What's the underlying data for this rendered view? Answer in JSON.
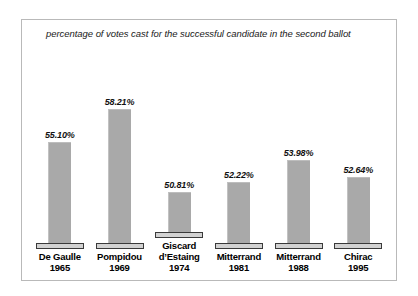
{
  "chart_data": {
    "type": "bar",
    "title": "percentage of votes cast for the successful candidate in the second ballot",
    "xlabel": "",
    "ylabel": "",
    "grid": false,
    "legend": "none",
    "ylim": [
      49.5,
      59.5
    ],
    "value_suffix": "%",
    "categories": [
      "De Gaulle 1965",
      "Pompidou 1969",
      "Giscard d'Estaing 1974",
      "Mitterrand 1981",
      "Mitterrand 1988",
      "Chirac 1995"
    ],
    "values": [
      55.1,
      58.21,
      50.81,
      52.22,
      53.98,
      52.64
    ],
    "bars": [
      {
        "name": "De Gaulle",
        "year": "1965",
        "value": 55.1,
        "value_label": "55.10%",
        "name_lines": [
          "De Gaulle",
          "1965"
        ],
        "bar_height_px": 101
      },
      {
        "name": "Pompidou",
        "year": "1969",
        "value": 58.21,
        "value_label": "58.21%",
        "name_lines": [
          "Pompidou",
          "1969"
        ],
        "bar_height_px": 134
      },
      {
        "name": "Giscard d'Estaing",
        "year": "1974",
        "value": 50.81,
        "value_label": "50.81%",
        "name_lines": [
          "Giscard",
          "d’Estaing",
          "1974"
        ],
        "bar_height_px": 40
      },
      {
        "name": "Mitterrand",
        "year": "1981",
        "value": 52.22,
        "value_label": "52.22%",
        "name_lines": [
          "Mitterrand",
          "1981"
        ],
        "bar_height_px": 61
      },
      {
        "name": "Mitterrand",
        "year": "1988",
        "value": 53.98,
        "value_label": "53.98%",
        "name_lines": [
          "Mitterrand",
          "1988"
        ],
        "bar_height_px": 83
      },
      {
        "name": "Chirac",
        "year": "1995",
        "value": 52.64,
        "value_label": "52.64%",
        "name_lines": [
          "Chirac",
          "1995"
        ],
        "bar_height_px": 66
      }
    ],
    "colors": {
      "bar_fill": "#a9a9a9",
      "base_plate_fill": "#d2d2d2",
      "base_plate_border": "#3a3a3a",
      "frame_border": "#b9b9b9",
      "background": "#ffffff",
      "text": "#000000"
    }
  }
}
